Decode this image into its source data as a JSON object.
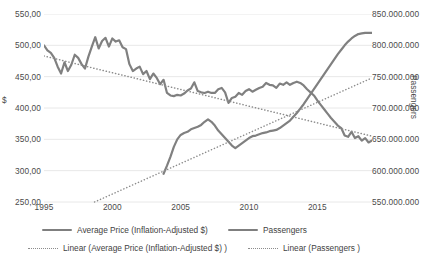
{
  "chart_data": {
    "type": "line",
    "title": "",
    "xlabel": "",
    "ylabel": "$",
    "y2label": "Passengers",
    "grid": true,
    "legend_position": "bottom",
    "xlim": [
      1995,
      2019
    ],
    "ylim": [
      250,
      550
    ],
    "y2lim": [
      550000000,
      850000000
    ],
    "x_ticks": [
      "1995",
      "2000",
      "2005",
      "2010",
      "2015"
    ],
    "x_tick_values": [
      1995,
      2000,
      2005,
      2010,
      2015
    ],
    "y_ticks_left": [
      "250,00",
      "300,00",
      "350,00",
      "400,00",
      "450,00",
      "500,00",
      "550,00"
    ],
    "y_tick_values_left": [
      250,
      300,
      350,
      400,
      450,
      500,
      550
    ],
    "y_ticks_right": [
      "550.000.000",
      "600.000.000",
      "650.000.000",
      "700.000.000",
      "750.000.000",
      "800.000.000",
      "850.000.000"
    ],
    "y_tick_values_right": [
      550000000,
      600000000,
      650000000,
      700000000,
      750000000,
      800000000,
      850000000
    ],
    "series": [
      {
        "name": "Average Price (Inflation-Adjusted $)",
        "axis": "left",
        "style": "solid",
        "color": "#808080",
        "x": [
          1995.0,
          1995.25,
          1995.5,
          1995.75,
          1996.0,
          1996.25,
          1996.5,
          1996.75,
          1997.0,
          1997.25,
          1997.5,
          1997.75,
          1998.0,
          1998.25,
          1998.5,
          1998.75,
          1999.0,
          1999.25,
          1999.5,
          1999.75,
          2000.0,
          2000.25,
          2000.5,
          2000.75,
          2001.0,
          2001.25,
          2001.5,
          2001.75,
          2002.0,
          2002.25,
          2002.5,
          2002.75,
          2003.0,
          2003.25,
          2003.5,
          2003.75,
          2004.0,
          2004.25,
          2004.5,
          2004.75,
          2005.0,
          2005.25,
          2005.5,
          2005.75,
          2006.0,
          2006.25,
          2006.5,
          2006.75,
          2007.0,
          2007.25,
          2007.5,
          2007.75,
          2008.0,
          2008.25,
          2008.5,
          2008.75,
          2009.0,
          2009.25,
          2009.5,
          2009.75,
          2010.0,
          2010.25,
          2010.5,
          2010.75,
          2011.0,
          2011.25,
          2011.5,
          2011.75,
          2012.0,
          2012.25,
          2012.5,
          2012.75,
          2013.0,
          2013.25,
          2013.5,
          2013.75,
          2014.0,
          2014.25,
          2014.5,
          2014.75,
          2015.0,
          2015.25,
          2015.5,
          2015.75,
          2016.0,
          2016.25,
          2016.5,
          2016.75,
          2017.0,
          2017.25,
          2017.5,
          2017.75,
          2018.0,
          2018.25,
          2018.5,
          2018.75,
          2019.0
        ],
        "values": [
          500,
          492,
          488,
          480,
          466,
          455,
          473,
          459,
          469,
          485,
          480,
          470,
          463,
          482,
          498,
          513,
          495,
          507,
          512,
          498,
          511,
          506,
          508,
          497,
          494,
          470,
          459,
          463,
          466,
          454,
          459,
          446,
          455,
          448,
          438,
          445,
          424,
          420,
          419,
          421,
          420,
          423,
          428,
          431,
          441,
          427,
          425,
          424,
          426,
          424,
          424,
          430,
          432,
          425,
          408,
          416,
          418,
          424,
          421,
          427,
          430,
          426,
          429,
          432,
          434,
          440,
          437,
          436,
          432,
          439,
          437,
          441,
          437,
          440,
          442,
          440,
          436,
          430,
          425,
          420,
          412,
          405,
          398,
          391,
          384,
          378,
          372,
          368,
          356,
          354,
          362,
          352,
          355,
          348,
          352,
          345,
          348
        ]
      },
      {
        "name": "Passengers",
        "axis": "right",
        "style": "solid",
        "color": "#808080",
        "x": [
          2003.75,
          2004.0,
          2004.25,
          2004.5,
          2004.75,
          2005.0,
          2005.25,
          2005.5,
          2005.75,
          2006.0,
          2006.25,
          2006.5,
          2006.75,
          2007.0,
          2007.25,
          2007.5,
          2007.75,
          2008.0,
          2008.25,
          2008.5,
          2008.75,
          2009.0,
          2009.25,
          2009.5,
          2009.75,
          2010.0,
          2010.25,
          2010.5,
          2010.75,
          2011.0,
          2011.25,
          2011.5,
          2011.75,
          2012.0,
          2012.25,
          2012.5,
          2012.75,
          2013.0,
          2013.25,
          2013.5,
          2013.75,
          2014.0,
          2014.25,
          2014.5,
          2014.75,
          2015.0,
          2015.25,
          2015.5,
          2015.75,
          2016.0,
          2016.25,
          2016.5,
          2016.75,
          2017.0,
          2017.25,
          2017.5,
          2017.75,
          2018.0,
          2018.25,
          2018.5,
          2018.75,
          2019.0
        ],
        "values": [
          595000000,
          608000000,
          622000000,
          638000000,
          650000000,
          657000000,
          660000000,
          662000000,
          666000000,
          668000000,
          670000000,
          673000000,
          678000000,
          682000000,
          678000000,
          672000000,
          664000000,
          658000000,
          652000000,
          646000000,
          640000000,
          636000000,
          640000000,
          644000000,
          648000000,
          652000000,
          655000000,
          656000000,
          658000000,
          660000000,
          661000000,
          663000000,
          664000000,
          665000000,
          668000000,
          672000000,
          676000000,
          680000000,
          686000000,
          692000000,
          699000000,
          706000000,
          714000000,
          722000000,
          730000000,
          738000000,
          746000000,
          754000000,
          762000000,
          770000000,
          778000000,
          786000000,
          793000000,
          800000000,
          806000000,
          811000000,
          815000000,
          818000000,
          819000000,
          820000000,
          820000000,
          820000000
        ]
      },
      {
        "name": "Linear (Average Price (Inflation-Adjusted $) )",
        "axis": "left",
        "style": "dotted",
        "color": "#8c8c8c",
        "trend_from": [
          1995.0,
          483
        ],
        "trend_to": [
          2019.0,
          355
        ]
      },
      {
        "name": "Linear (Passengers )",
        "axis": "right",
        "style": "dotted",
        "color": "#8c8c8c",
        "trend_from": [
          1998.7,
          550000000
        ],
        "trend_to": [
          2019.0,
          748000000
        ]
      }
    ],
    "legend": [
      {
        "label": "Average Price (Inflation-Adjusted $)",
        "style": "solid"
      },
      {
        "label": "Passengers",
        "style": "solid"
      },
      {
        "label": "Linear (Average Price (Inflation-Adjusted $) )",
        "style": "dotted"
      },
      {
        "label": "Linear (Passengers )",
        "style": "dotted"
      }
    ]
  }
}
